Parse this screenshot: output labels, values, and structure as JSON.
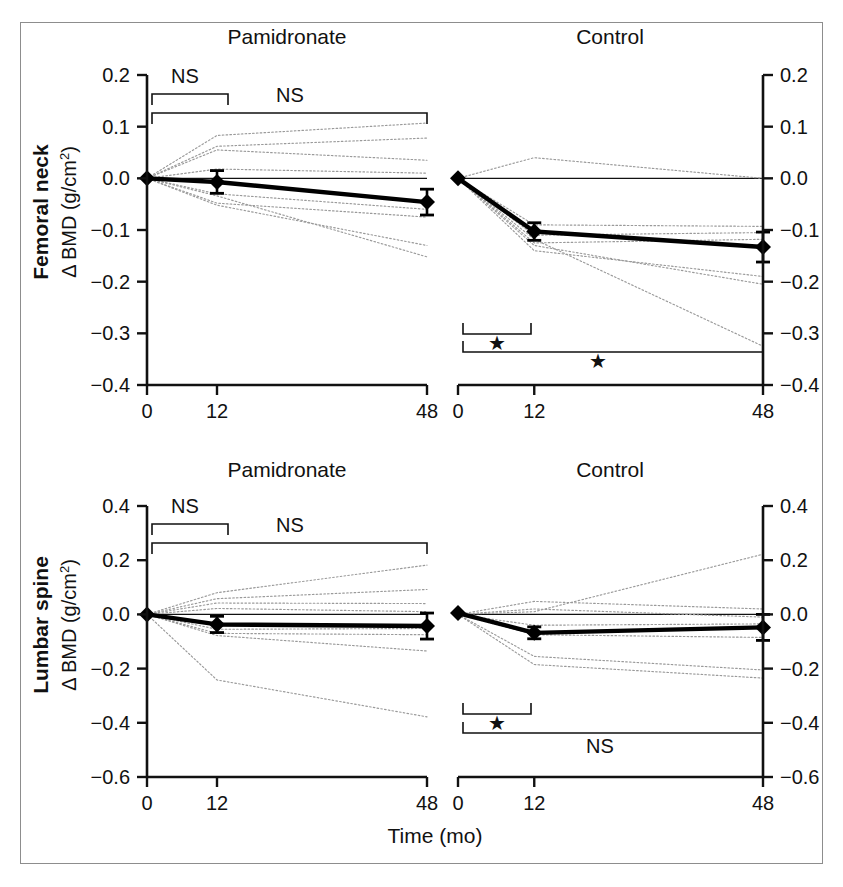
{
  "figure": {
    "xaxis_title": "Time (mo)",
    "row_labels": [
      {
        "bold": "Femoral neck",
        "unit_prefix": "Δ BMD (g/cm",
        "unit_sup": "2",
        "unit_suffix": ")"
      },
      {
        "bold": "Lumbar spine",
        "unit_prefix": "Δ BMD (g/cm",
        "unit_sup": "2",
        "unit_suffix": ")"
      }
    ],
    "column_titles": [
      "Pamidronate",
      "Control"
    ],
    "x_tick_labels": [
      "0",
      "12",
      "48"
    ],
    "star_glyph": "★",
    "ns_glyph": "NS"
  },
  "chart_data": [
    {
      "id": "femoral-neck-pamidronate",
      "type": "line",
      "title": "Pamidronate",
      "row": "Femoral neck",
      "xlabel": "Time (mo)",
      "ylabel": "Δ BMD (g/cm2)",
      "x": [
        0,
        12,
        48
      ],
      "xlim": [
        0,
        48
      ],
      "ylim": [
        -0.4,
        0.2
      ],
      "y_ticks": [
        0.2,
        0.1,
        0.0,
        -0.1,
        -0.2,
        -0.3,
        -0.4
      ],
      "y_tick_labels": [
        "0.2",
        "0.1",
        "0.0",
        "−0.1",
        "−0.2",
        "−0.3",
        "−0.4"
      ],
      "x_ticks": [
        0,
        12,
        48
      ],
      "x_tick_labels": [
        "0",
        "12",
        "48"
      ],
      "grid": false,
      "zero_line": true,
      "axis_side": "left",
      "mean_series": {
        "name": "Group mean ± SEM",
        "values": [
          0.0,
          -0.007,
          -0.046
        ],
        "errors": [
          0.0,
          0.022,
          0.025
        ],
        "marker": "diamond"
      },
      "individual_series": [
        {
          "name": "subject-1",
          "values": [
            0.0,
            0.083,
            0.107
          ]
        },
        {
          "name": "subject-2",
          "values": [
            0.0,
            0.062,
            0.078
          ]
        },
        {
          "name": "subject-3",
          "values": [
            0.0,
            0.055,
            0.035
          ]
        },
        {
          "name": "subject-4",
          "values": [
            0.0,
            0.018,
            0.01
          ]
        },
        {
          "name": "subject-5",
          "values": [
            0.0,
            -0.03,
            -0.06
          ]
        },
        {
          "name": "subject-6",
          "values": [
            0.0,
            -0.048,
            -0.075
          ]
        },
        {
          "name": "subject-7",
          "values": [
            0.0,
            -0.052,
            -0.13
          ]
        },
        {
          "name": "subject-8",
          "values": [
            0.0,
            -0.034,
            -0.152
          ]
        }
      ],
      "significance_brackets": [
        {
          "label": "NS",
          "from": 0,
          "to": 12,
          "direction": "up",
          "label_position": "above"
        },
        {
          "label": "NS",
          "from": 0,
          "to": 48,
          "direction": "up",
          "label_position": "above"
        }
      ]
    },
    {
      "id": "femoral-neck-control",
      "type": "line",
      "title": "Control",
      "row": "Femoral neck",
      "xlabel": "Time (mo)",
      "ylabel": "Δ BMD (g/cm2)",
      "x": [
        0,
        12,
        48
      ],
      "xlim": [
        0,
        48
      ],
      "ylim": [
        -0.4,
        0.2
      ],
      "y_ticks": [
        0.2,
        0.1,
        0.0,
        -0.1,
        -0.2,
        -0.3,
        -0.4
      ],
      "y_tick_labels": [
        "0.2",
        "0.1",
        "0.0",
        "−0.1",
        "−0.2",
        "−0.3",
        "−0.4"
      ],
      "x_ticks": [
        0,
        12,
        48
      ],
      "x_tick_labels": [
        "0",
        "12",
        "48"
      ],
      "grid": false,
      "zero_line": true,
      "axis_side": "right",
      "mean_series": {
        "name": "Group mean ± SEM",
        "values": [
          0.0,
          -0.103,
          -0.133
        ],
        "errors": [
          0.0,
          0.017,
          0.029
        ],
        "marker": "diamond"
      },
      "individual_series": [
        {
          "name": "subject-1",
          "values": [
            0.0,
            0.04,
            0.0
          ]
        },
        {
          "name": "subject-2",
          "values": [
            0.0,
            -0.09,
            -0.093
          ]
        },
        {
          "name": "subject-3",
          "values": [
            0.0,
            -0.11,
            -0.105
          ]
        },
        {
          "name": "subject-4",
          "values": [
            0.0,
            -0.125,
            -0.118
          ]
        },
        {
          "name": "subject-5",
          "values": [
            0.0,
            -0.13,
            -0.205
          ]
        },
        {
          "name": "subject-6",
          "values": [
            0.0,
            -0.14,
            -0.19
          ]
        },
        {
          "name": "subject-7",
          "values": [
            0.0,
            -0.118,
            -0.325
          ]
        }
      ],
      "significance_brackets": [
        {
          "label": "★",
          "from": 0,
          "to": 12,
          "direction": "down",
          "label_position": "below"
        },
        {
          "label": "★",
          "from": 0,
          "to": 48,
          "direction": "down",
          "label_position": "below"
        }
      ]
    },
    {
      "id": "lumbar-spine-pamidronate",
      "type": "line",
      "title": "Pamidronate",
      "row": "Lumbar spine",
      "xlabel": "Time (mo)",
      "ylabel": "Δ BMD (g/cm2)",
      "x": [
        0,
        12,
        48
      ],
      "xlim": [
        0,
        48
      ],
      "ylim": [
        -0.6,
        0.4
      ],
      "y_ticks": [
        0.4,
        0.2,
        0.0,
        -0.2,
        -0.4,
        -0.6
      ],
      "y_tick_labels": [
        "0.4",
        "0.2",
        "0.0",
        "−0.2",
        "−0.4",
        "−0.6"
      ],
      "x_ticks": [
        0,
        12,
        48
      ],
      "x_tick_labels": [
        "0",
        "12",
        "48"
      ],
      "grid": false,
      "zero_line": true,
      "axis_side": "left",
      "mean_series": {
        "name": "Group mean ± SEM",
        "values": [
          0.0,
          -0.037,
          -0.043
        ],
        "errors": [
          0.0,
          0.03,
          0.048
        ],
        "marker": "diamond"
      },
      "individual_series": [
        {
          "name": "subject-1",
          "values": [
            0.0,
            0.08,
            0.182
          ]
        },
        {
          "name": "subject-2",
          "values": [
            0.0,
            0.058,
            0.092
          ]
        },
        {
          "name": "subject-3",
          "values": [
            0.0,
            0.042,
            0.04
          ]
        },
        {
          "name": "subject-4",
          "values": [
            0.0,
            0.022,
            0.01
          ]
        },
        {
          "name": "subject-5",
          "values": [
            0.0,
            -0.055,
            -0.052
          ]
        },
        {
          "name": "subject-6",
          "values": [
            0.0,
            -0.07,
            -0.075
          ]
        },
        {
          "name": "subject-7",
          "values": [
            0.0,
            -0.078,
            -0.135
          ]
        },
        {
          "name": "subject-8",
          "values": [
            0.0,
            -0.242,
            -0.378
          ]
        }
      ],
      "significance_brackets": [
        {
          "label": "NS",
          "from": 0,
          "to": 12,
          "direction": "up",
          "label_position": "above"
        },
        {
          "label": "NS",
          "from": 0,
          "to": 48,
          "direction": "up",
          "label_position": "above"
        }
      ]
    },
    {
      "id": "lumbar-spine-control",
      "type": "line",
      "title": "Control",
      "row": "Lumbar spine",
      "xlabel": "Time (mo)",
      "ylabel": "Δ BMD (g/cm2)",
      "x": [
        0,
        12,
        48
      ],
      "xlim": [
        -0.6,
        0.4
      ],
      "ylim": [
        -0.6,
        0.4
      ],
      "y_ticks": [
        0.4,
        0.2,
        0.0,
        -0.2,
        -0.4,
        -0.6
      ],
      "y_tick_labels": [
        "0.4",
        "0.2",
        "0.0",
        "−0.2",
        "−0.4",
        "−0.6"
      ],
      "x_ticks": [
        0,
        12,
        48
      ],
      "x_tick_labels": [
        "0",
        "12",
        "48"
      ],
      "grid": false,
      "zero_line": true,
      "axis_side": "right",
      "mean_series": {
        "name": "Group mean ± SEM",
        "values": [
          0.005,
          -0.068,
          -0.048
        ],
        "errors": [
          0.0,
          0.022,
          0.048
        ],
        "marker": "diamond"
      },
      "individual_series": [
        {
          "name": "subject-1",
          "values": [
            0.0,
            0.01,
            0.222
          ]
        },
        {
          "name": "subject-2",
          "values": [
            0.0,
            0.048,
            0.02
          ]
        },
        {
          "name": "subject-3",
          "values": [
            0.0,
            0.02,
            -0.01
          ]
        },
        {
          "name": "subject-4",
          "values": [
            0.0,
            -0.04,
            -0.035
          ]
        },
        {
          "name": "subject-5",
          "values": [
            0.0,
            -0.075,
            -0.085
          ]
        },
        {
          "name": "subject-6",
          "values": [
            0.0,
            -0.155,
            -0.205
          ]
        },
        {
          "name": "subject-7",
          "values": [
            0.0,
            -0.185,
            -0.235
          ]
        }
      ],
      "significance_brackets": [
        {
          "label": "★",
          "from": 0,
          "to": 12,
          "direction": "down",
          "label_position": "below"
        },
        {
          "label": "NS",
          "from": 0,
          "to": 48,
          "direction": "down",
          "label_position": "below"
        }
      ]
    }
  ],
  "colors": {
    "frame": "#8d8d8d",
    "axis": "#111111",
    "mean_line": "#000000",
    "individual_line": "#9a9a9a",
    "text": "#111111",
    "background": "#ffffff"
  }
}
